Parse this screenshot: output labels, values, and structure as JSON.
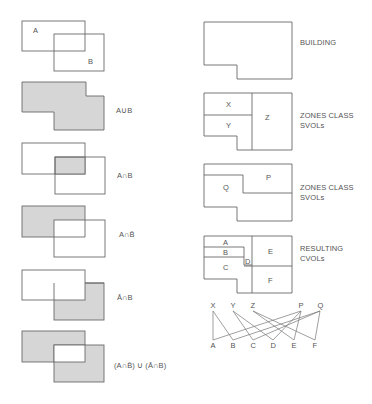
{
  "venn_examples": [
    {
      "id": "base",
      "labels": {
        "a": "A",
        "b": "B"
      },
      "caption": ""
    },
    {
      "id": "union",
      "caption": "A∪B"
    },
    {
      "id": "intersection",
      "caption": "A∩B"
    },
    {
      "id": "a-and-not-b",
      "caption": "A∩B̄"
    },
    {
      "id": "not-a-and-b",
      "caption": "Ā∩B"
    },
    {
      "id": "symmetric-difference",
      "caption": "(A∩B̄) ∪ (Ā∩B)"
    }
  ],
  "building": {
    "caption": "BUILDING"
  },
  "zones_xyz": {
    "caption_line1": "ZONES CLASS",
    "caption_line2": "SVOLs",
    "regions": [
      "X",
      "Y",
      "Z"
    ]
  },
  "zones_pq": {
    "caption_line1": "ZONES CLASS",
    "caption_line2": "SVOLs",
    "regions": [
      "P",
      "Q"
    ]
  },
  "resulting": {
    "caption_line1": "RESULTING",
    "caption_line2": "CVOLs",
    "regions": [
      "A",
      "B",
      "C",
      "D",
      "E",
      "F"
    ]
  },
  "graph": {
    "top_nodes": [
      "X",
      "Y",
      "Z",
      "P",
      "Q"
    ],
    "bottom_nodes": [
      "A",
      "B",
      "C",
      "D",
      "E",
      "F"
    ],
    "edges": [
      [
        "X",
        "A"
      ],
      [
        "X",
        "B"
      ],
      [
        "Y",
        "C"
      ],
      [
        "Y",
        "D"
      ],
      [
        "Z",
        "E"
      ],
      [
        "Z",
        "F"
      ],
      [
        "P",
        "A"
      ],
      [
        "P",
        "D"
      ],
      [
        "P",
        "E"
      ],
      [
        "Q",
        "B"
      ],
      [
        "Q",
        "C"
      ],
      [
        "Q",
        "F"
      ]
    ]
  },
  "colors": {
    "shade": "#d6d6d6",
    "line": "#6a6a6a"
  }
}
